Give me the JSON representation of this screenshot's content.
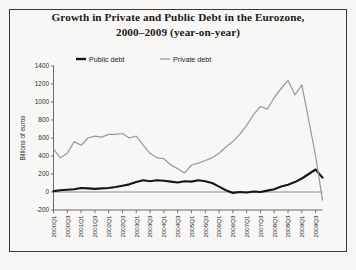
{
  "figure": {
    "title_line1": "Growth in Private and Public Debt in the Eurozone,",
    "title_line2": "2000–2009 (year-on-year)",
    "border_color": "#3a3a3a",
    "background_color": "#f8f7f5"
  },
  "chart_data": {
    "type": "line",
    "title": "Growth in Private and Public Debt in the Eurozone, 2000–2009 (year-on-year)",
    "xlabel": "",
    "ylabel": "Billions of euros",
    "ylim": [
      -200,
      1400
    ],
    "ytick_step": 200,
    "yticks": [
      -200,
      0,
      200,
      400,
      600,
      800,
      1000,
      1200,
      1400
    ],
    "ytick_labels": [
      "-200",
      "0",
      "200",
      "400",
      "600",
      "800",
      "1000",
      "1200",
      "1400"
    ],
    "grid": false,
    "legend_position": "top-center",
    "x": [
      "2000Q1",
      "2000Q2",
      "2000Q3",
      "2000Q4",
      "2001Q1",
      "2001Q2",
      "2001Q3",
      "2001Q4",
      "2002Q1",
      "2002Q2",
      "2002Q3",
      "2002Q4",
      "2003Q1",
      "2003Q2",
      "2003Q3",
      "2003Q4",
      "2004Q1",
      "2004Q2",
      "2004Q3",
      "2004Q4",
      "2005Q1",
      "2005Q2",
      "2005Q3",
      "2005Q4",
      "2006Q1",
      "2006Q2",
      "2006Q3",
      "2006Q4",
      "2007Q1",
      "2007Q2",
      "2007Q3",
      "2007Q4",
      "2008Q1",
      "2008Q2",
      "2008Q3",
      "2008Q4",
      "2009Q1",
      "2009Q2",
      "2009Q3",
      "2009Q4"
    ],
    "xtick_labels": [
      "2000Q1",
      "2000Q3",
      "2001Q1",
      "2001Q3",
      "2002Q1",
      "2002Q3",
      "2003Q1",
      "2003Q3",
      "2004Q1",
      "2004Q3",
      "2005Q1",
      "2005Q3",
      "2006Q1",
      "2006Q3",
      "2007Q1",
      "2007Q3",
      "2008Q1",
      "2008Q3",
      "2009Q1",
      "2009Q3"
    ],
    "series": [
      {
        "name": "Public debt",
        "color": "#161616",
        "line_width": 2.1,
        "values": [
          10,
          20,
          25,
          30,
          45,
          40,
          35,
          40,
          45,
          55,
          70,
          85,
          110,
          130,
          120,
          130,
          125,
          115,
          105,
          120,
          115,
          130,
          120,
          100,
          60,
          20,
          -10,
          0,
          -5,
          5,
          0,
          15,
          30,
          60,
          80,
          110,
          150,
          200,
          250,
          160
        ]
      },
      {
        "name": "Private debt",
        "color": "#9a9a9a",
        "line_width": 1.25,
        "values": [
          480,
          380,
          430,
          560,
          520,
          600,
          620,
          610,
          640,
          640,
          650,
          600,
          620,
          520,
          430,
          380,
          370,
          300,
          260,
          210,
          300,
          320,
          350,
          380,
          430,
          500,
          560,
          640,
          740,
          860,
          950,
          920,
          1050,
          1150,
          1240,
          1080,
          1190,
          800,
          400,
          -90
        ]
      }
    ]
  },
  "legend": {
    "items": [
      {
        "label": "Public debt",
        "color": "#161616"
      },
      {
        "label": "Private debt",
        "color": "#9a9a9a"
      }
    ]
  }
}
